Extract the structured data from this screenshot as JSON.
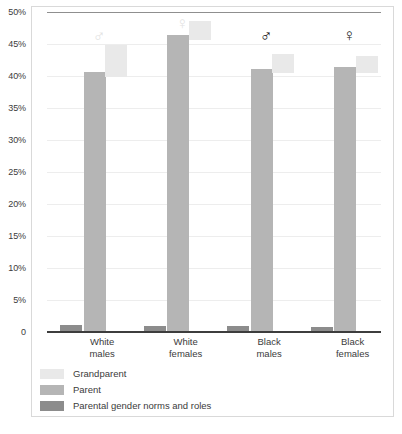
{
  "chart_data": {
    "type": "bar",
    "title": "",
    "subtitle": "",
    "xlabel": "",
    "ylabel": "",
    "ylim": [
      0,
      50
    ],
    "grid": true,
    "legend_position": "bottom-left",
    "categories": [
      "White males",
      "White females",
      "Black males",
      "Black females"
    ],
    "category_lines": [
      [
        "White",
        "males"
      ],
      [
        "White",
        "females"
      ],
      [
        "Black",
        "males"
      ],
      [
        "Black",
        "females"
      ]
    ],
    "ytick_labels": [
      "50%",
      "45%",
      "40%",
      "35%",
      "30%",
      "25%",
      "20%",
      "15%",
      "10%",
      "5%",
      "0"
    ],
    "ytick_values": [
      50,
      45,
      40,
      35,
      30,
      25,
      20,
      15,
      10,
      5,
      0
    ],
    "series": [
      {
        "name": "Grandparent",
        "color": "#e9e9e9",
        "values": [
          44.8,
          48.6,
          43.4,
          43.2
        ],
        "base_values": [
          39.9,
          45.6,
          40.4,
          40.5
        ],
        "floating": true
      },
      {
        "name": "Parent",
        "color": "#b5b5b5",
        "values": [
          40.5,
          46.2,
          41.0,
          41.3
        ]
      },
      {
        "name": "Parental gender norms and roles",
        "color": "#8c8c8c",
        "values": [
          0.9,
          0.8,
          0.8,
          0.6
        ]
      }
    ],
    "annotations": [
      {
        "category": "White males",
        "symbol": "♂",
        "style": "faint",
        "value_top": 47.5
      },
      {
        "category": "White females",
        "symbol": "♀",
        "style": "faint",
        "value_top": 49.6
      },
      {
        "category": "Black males",
        "symbol": "♂",
        "style": "solid",
        "value_top": 47.6
      },
      {
        "category": "Black females",
        "symbol": "♀",
        "style": "solid",
        "value_top": 47.6
      }
    ]
  },
  "legend": {
    "items": [
      {
        "label": "Grandparent",
        "color": "#e9e9e9"
      },
      {
        "label": "Parent",
        "color": "#b5b5b5"
      },
      {
        "label": "Parental gender norms and roles",
        "color": "#8c8c8c"
      }
    ]
  }
}
